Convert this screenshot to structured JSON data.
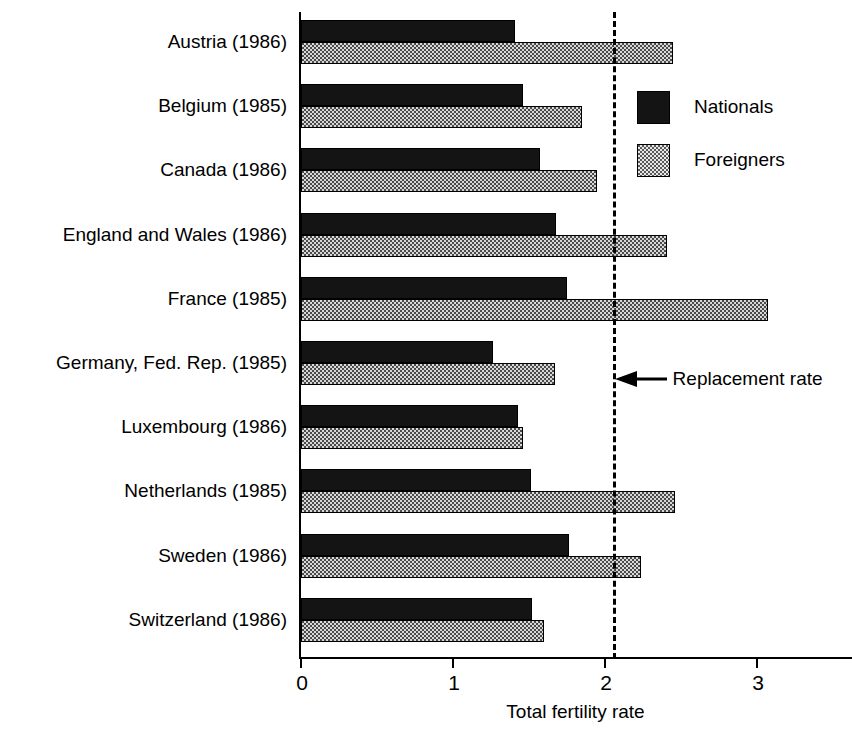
{
  "chart_data": {
    "type": "bar",
    "orientation": "horizontal",
    "title": "",
    "xlabel": "Total fertility rate",
    "ylabel": "",
    "xlim": [
      0,
      3.6
    ],
    "xticks": [
      0,
      1,
      2,
      3
    ],
    "xtick_labels": [
      "0",
      "1",
      "2",
      "3"
    ],
    "grid": false,
    "legend_position": "upper-right-inside",
    "categories": [
      "Austria (1986)",
      "Belgium (1985)",
      "Canada (1986)",
      "England and Wales (1986)",
      "France (1985)",
      "Germany, Fed. Rep. (1985)",
      "Luxembourg (1986)",
      "Netherlands (1985)",
      "Sweden (1986)",
      "Switzerland (1986)"
    ],
    "series": [
      {
        "name": "Nationals",
        "pattern": "solid-black",
        "color": "#141414",
        "values": [
          1.41,
          1.46,
          1.57,
          1.68,
          1.75,
          1.26,
          1.43,
          1.51,
          1.76,
          1.52
        ]
      },
      {
        "name": "Foreigners",
        "pattern": "checkered",
        "color": "#5a5a5a",
        "values": [
          2.45,
          1.85,
          1.95,
          2.41,
          3.07,
          1.67,
          1.46,
          2.46,
          2.24,
          1.6
        ]
      }
    ],
    "annotations": [
      {
        "label": "Replacement rate",
        "value": 2.05,
        "style": "dashed-vertical-line-with-left-arrow"
      }
    ]
  },
  "legend": {
    "entries": [
      {
        "label": "Nationals"
      },
      {
        "label": "Foreigners"
      }
    ]
  },
  "axis": {
    "x_title": "Total fertility rate"
  }
}
